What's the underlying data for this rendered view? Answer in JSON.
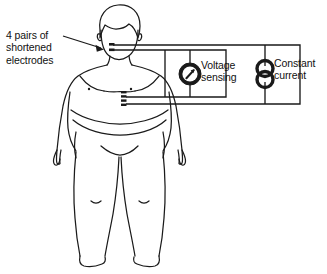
{
  "figure": {
    "type": "bioimpedance-measurement-diagram",
    "background_color": "#ffffff",
    "line_color": "#1a1a1a"
  },
  "annotations": {
    "electrodes_label": "4 pairs of\nshortened\nelectrodes",
    "electrodes_label_lines": [
      "4 pairs of",
      "shortened",
      "electrodes"
    ],
    "voltage_label": "Voltage\nsensing",
    "voltage_label_lines": [
      "Voltage",
      "sensing"
    ],
    "current_label": "Constant\ncurrent",
    "current_label_lines": [
      "Constant",
      "current"
    ]
  },
  "components": {
    "voltage_meter": {
      "name": "voltage-sensing-meter",
      "symbol": "circle-with-needle-arrow",
      "cx": 190,
      "cy": 74,
      "r": 11
    },
    "current_source": {
      "name": "constant-current-source",
      "symbol": "double-circle-figure-eight",
      "cx": 265,
      "cy": 74,
      "r": 8
    }
  },
  "electrode_sites": {
    "neck": {
      "label": "neck electrode pair",
      "x": 113,
      "y": 50
    },
    "waist": {
      "label": "waist electrode pair",
      "x": 122,
      "y": 96
    }
  },
  "pointer_arrow": {
    "name": "electrodes-pointer-arrow",
    "from_x": 63,
    "from_y": 37,
    "to_x": 104,
    "to_y": 49
  },
  "colors": {
    "ink": "#1a1a1a",
    "paper": "#ffffff"
  }
}
